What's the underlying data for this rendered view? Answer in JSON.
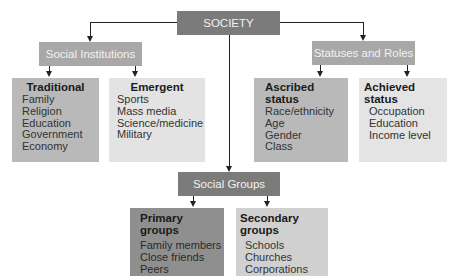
{
  "root": {
    "label": "SOCIETY"
  },
  "branches": [
    {
      "label": "Social Institutions",
      "children": [
        {
          "title": "Traditional",
          "items": [
            "Family",
            "Religion",
            "Education",
            "Government",
            "Economy"
          ]
        },
        {
          "title": "Emergent",
          "items": [
            "Sports",
            "Mass media",
            "Science/medicine",
            "Military"
          ]
        }
      ]
    },
    {
      "label": "Statuses and Roles",
      "children": [
        {
          "title": "Ascribed status",
          "items": [
            "Race/ethnicity",
            "Age",
            "Gender",
            "Class"
          ]
        },
        {
          "title": "Achieved status",
          "items": [
            "Occupation",
            "Education",
            "Income level"
          ]
        }
      ]
    },
    {
      "label": "Social Groups",
      "children": [
        {
          "title": "Primary groups",
          "items": [
            "Family members",
            "Close friends",
            "Peers"
          ]
        },
        {
          "title": "Secondary groups",
          "items": [
            "Schools",
            "Churches",
            "Corporations"
          ]
        }
      ]
    }
  ]
}
